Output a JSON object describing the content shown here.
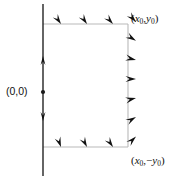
{
  "figure": {
    "type": "vector-field-diagram",
    "background_color": "#ffffff",
    "axis_color": "#1a1a1a",
    "box_color": "#b9b9b9",
    "arrow_color": "#111111",
    "labels": {
      "origin": "(0,0)",
      "top_right": {
        "open_paren": "(",
        "x_var": "x",
        "x_sub": "0",
        "comma": ",",
        "y_var": "y",
        "y_sub": "0",
        "close_paren": ")"
      },
      "bottom_right": {
        "open_paren": "(",
        "x_var": "x",
        "x_sub": "0",
        "comma": ",",
        "minus": "−",
        "y_var": "y",
        "y_sub": "0",
        "close_paren": ")"
      }
    },
    "geometry": {
      "vertical_axis_x": 43,
      "vertical_axis_y_top": 4,
      "vertical_axis_y_bottom": 176,
      "box_left_x": 43,
      "box_right_x": 128,
      "box_top_y": 24,
      "box_bottom_y": 147,
      "origin_dot": {
        "x": 43,
        "y": 92,
        "r": 2.1
      }
    },
    "axis_arrows": [
      {
        "name": "axis-arrow-up",
        "x": 43,
        "y": 56,
        "angle": -90
      },
      {
        "name": "axis-arrow-down",
        "x": 43,
        "y": 121,
        "angle": 90
      }
    ],
    "top_edge_arrows": [
      {
        "x": 61,
        "y": 24,
        "angle": 55
      },
      {
        "x": 87,
        "y": 24,
        "angle": 55
      },
      {
        "x": 113,
        "y": 24,
        "angle": 48
      }
    ],
    "bottom_edge_arrows": [
      {
        "x": 61,
        "y": 147,
        "angle": 70
      },
      {
        "x": 87,
        "y": 147,
        "angle": 62
      },
      {
        "x": 113,
        "y": 147,
        "angle": 55
      }
    ],
    "right_edge_arrows": [
      {
        "x": 128,
        "y": 28,
        "angle": 48
      },
      {
        "x": 128,
        "y": 45,
        "angle": 32
      },
      {
        "x": 128,
        "y": 62,
        "angle": 14
      },
      {
        "x": 128,
        "y": 79,
        "angle": 0
      },
      {
        "x": 128,
        "y": 96,
        "angle": -14
      },
      {
        "x": 128,
        "y": 113,
        "angle": -30
      },
      {
        "x": 128,
        "y": 131,
        "angle": -44
      }
    ]
  }
}
